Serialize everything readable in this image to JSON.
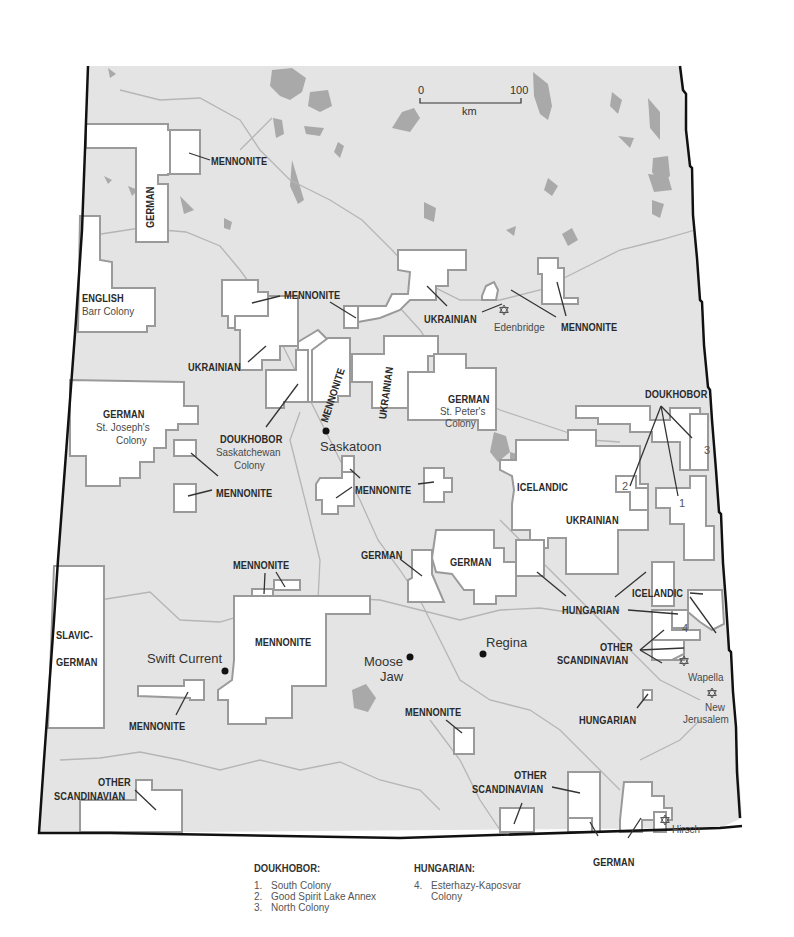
{
  "scale_bar": {
    "start": "0",
    "end": "100",
    "unit": "km"
  },
  "colors": {
    "land": "#e4e4e4",
    "settlement": "#ffffff",
    "settlement_border": "#9a9a9a",
    "water": "#a9a9a9",
    "border": "#111111",
    "river": "#b5b5b5"
  },
  "cities": [
    {
      "name": "Saskatoon"
    },
    {
      "name": "Regina"
    },
    {
      "name": "Moose Jaw",
      "line1": "Moose",
      "line2": "Jaw"
    },
    {
      "name": "Swift Current"
    }
  ],
  "jewish_colonies": [
    {
      "name": "Edenbridge"
    },
    {
      "name": "Wapella"
    },
    {
      "name": "New Jerusalem",
      "line1": "New",
      "line2": "Jerusalem"
    },
    {
      "name": "Hirsch"
    }
  ],
  "labels": {
    "mennonite": "MENNONITE",
    "german": "GERMAN",
    "ukrainian": "UKRAINIAN",
    "english": "ENGLISH",
    "barr_colony": "Barr Colony",
    "doukhobor": "DOUKHOBOR",
    "saskatchewan": "Saskatchewan",
    "colony": "Colony",
    "st_josephs": "St. Joseph's",
    "st_peters": "St. Peter's",
    "icelandic": "ICELANDIC",
    "hungarian": "HUNGARIAN",
    "other": "OTHER",
    "scandinavian": "SCANDINAVIAN",
    "slavic": "SLAVIC-",
    "n1": "1",
    "n2": "2",
    "n3": "3",
    "n4": "4"
  },
  "legend": {
    "doukhobor": {
      "title": "DOUKHOBOR:",
      "items": [
        {
          "num": "1.",
          "label": "South Colony"
        },
        {
          "num": "2.",
          "label": "Good Spirit Lake Annex"
        },
        {
          "num": "3.",
          "label": "North Colony"
        }
      ]
    },
    "hungarian": {
      "title": "HUNGARIAN:",
      "items": [
        {
          "num": "4.",
          "label": "Esterhazy-Kaposvar",
          "line2": "Colony"
        }
      ]
    }
  }
}
